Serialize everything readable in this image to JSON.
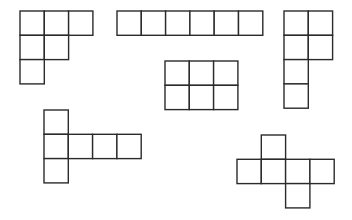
{
  "diagram": {
    "cell_size": 24.3,
    "stroke_color": "#2b2b2b",
    "fill_color": "#ffffff",
    "background": "#ffffff",
    "shapes": [
      {
        "name": "net-top-left-staircase",
        "origin": [
          20,
          11
        ],
        "cells": [
          [
            0,
            0
          ],
          [
            1,
            0
          ],
          [
            2,
            0
          ],
          [
            0,
            1
          ],
          [
            1,
            1
          ],
          [
            0,
            2
          ]
        ]
      },
      {
        "name": "net-top-row-of-six",
        "origin": [
          117,
          11
        ],
        "cells": [
          [
            0,
            0
          ],
          [
            1,
            0
          ],
          [
            2,
            0
          ],
          [
            3,
            0
          ],
          [
            4,
            0
          ],
          [
            5,
            0
          ]
        ]
      },
      {
        "name": "net-top-right-p-shape",
        "origin": [
          284,
          11
        ],
        "cells": [
          [
            0,
            0
          ],
          [
            1,
            0
          ],
          [
            0,
            1
          ],
          [
            1,
            1
          ],
          [
            0,
            2
          ],
          [
            0,
            3
          ]
        ]
      },
      {
        "name": "net-middle-2x3-rectangle",
        "origin": [
          165,
          61
        ],
        "cells": [
          [
            0,
            0
          ],
          [
            1,
            0
          ],
          [
            2,
            0
          ],
          [
            0,
            1
          ],
          [
            1,
            1
          ],
          [
            2,
            1
          ]
        ]
      },
      {
        "name": "net-bottom-left-t-shape",
        "origin": [
          44,
          110
        ],
        "cells": [
          [
            0,
            0
          ],
          [
            0,
            1
          ],
          [
            1,
            1
          ],
          [
            2,
            1
          ],
          [
            3,
            1
          ],
          [
            0,
            2
          ]
        ]
      },
      {
        "name": "net-bottom-right-cross",
        "origin": [
          237,
          135
        ],
        "cells": [
          [
            1,
            0
          ],
          [
            0,
            1
          ],
          [
            1,
            1
          ],
          [
            2,
            1
          ],
          [
            3,
            1
          ],
          [
            2,
            2
          ]
        ]
      }
    ]
  }
}
